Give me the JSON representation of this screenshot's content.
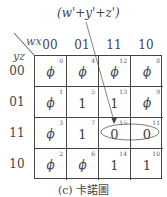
{
  "annotation": "(w'+y'+z')",
  "axes": {
    "col_var": "wx",
    "row_var": "yz"
  },
  "col_headers": [
    "00",
    "01",
    "11",
    "10"
  ],
  "row_headers": [
    "00",
    "01",
    "11",
    "10"
  ],
  "cells": [
    [
      {
        "idx": "0",
        "val": "ϕ"
      },
      {
        "idx": "4",
        "val": "ϕ"
      },
      {
        "idx": "12",
        "val": "ϕ"
      },
      {
        "idx": "8",
        "val": "ϕ"
      }
    ],
    [
      {
        "idx": "1",
        "val": "ϕ"
      },
      {
        "idx": "5",
        "val": "1"
      },
      {
        "idx": "13",
        "val": "1"
      },
      {
        "idx": "9",
        "val": "ϕ"
      }
    ],
    [
      {
        "idx": "3",
        "val": "ϕ"
      },
      {
        "idx": "7",
        "val": "1"
      },
      {
        "idx": "15",
        "val": "0"
      },
      {
        "idx": "11",
        "val": "0"
      }
    ],
    [
      {
        "idx": "2",
        "val": "ϕ"
      },
      {
        "idx": "6",
        "val": "ϕ"
      },
      {
        "idx": "14",
        "val": "1"
      },
      {
        "idx": "10",
        "val": "1"
      }
    ]
  ],
  "grouping": {
    "cells": [
      "15",
      "11"
    ],
    "label": "(w'+y'+z')"
  },
  "caption": "(c) 卡諾圖"
}
